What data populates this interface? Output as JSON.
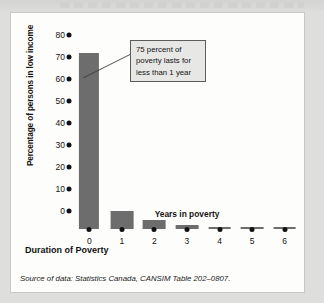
{
  "figure": {
    "title": "Duration of Poverty",
    "source": "Source of data: Statistics Canada, CANSIM Table 202–0807."
  },
  "callout": {
    "line1": "75 percent of",
    "line2": "poverty lasts for",
    "line3": "less than 1 year"
  },
  "chart_data": {
    "type": "bar",
    "title": "Duration of Poverty",
    "xlabel": "Years in poverty",
    "ylabel": "Percentage of persons in low income",
    "categories": [
      "0",
      "1",
      "2",
      "3",
      "4",
      "5",
      "6"
    ],
    "values": [
      80,
      8,
      4,
      2,
      1,
      1,
      1
    ],
    "ylim": [
      0,
      80
    ],
    "yticks": [
      0,
      10,
      20,
      30,
      40,
      50,
      60,
      70,
      80
    ],
    "ytick_labels": [
      "0",
      "10",
      "20",
      "30",
      "40",
      "50",
      "60",
      "70",
      "80"
    ],
    "grid": false,
    "legend": false,
    "bar_color": "#6d6d6d",
    "annotations": [
      {
        "text": "75 percent of poverty lasts for less than 1 year",
        "points_to_category": "0"
      }
    ]
  }
}
